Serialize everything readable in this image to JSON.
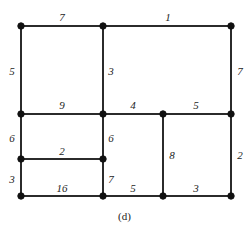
{
  "figure": {
    "caption": "(d)",
    "stroke_color": "#2b2b2b",
    "vertex_color": "#111111",
    "background_color": "#ffffff"
  },
  "chart_data": {
    "type": "diagram",
    "subtype": "planar-graph-rectangular-subdivision",
    "title": "",
    "caption": "(d)",
    "xlabel": "",
    "ylabel": "",
    "grid": false,
    "legend": null,
    "xlim": [
      0,
      249
    ],
    "ylim": [
      0,
      233
    ],
    "vertices": [
      {
        "id": "v1",
        "x": 21,
        "y": 26
      },
      {
        "id": "v2",
        "x": 103,
        "y": 26
      },
      {
        "id": "v3",
        "x": 231,
        "y": 26
      },
      {
        "id": "v4",
        "x": 21,
        "y": 114
      },
      {
        "id": "v5",
        "x": 103,
        "y": 114
      },
      {
        "id": "v6",
        "x": 163,
        "y": 114
      },
      {
        "id": "v7",
        "x": 231,
        "y": 114
      },
      {
        "id": "v8",
        "x": 21,
        "y": 159
      },
      {
        "id": "v9",
        "x": 103,
        "y": 159
      },
      {
        "id": "v10",
        "x": 21,
        "y": 196
      },
      {
        "id": "v11",
        "x": 103,
        "y": 196
      },
      {
        "id": "v12",
        "x": 163,
        "y": 196
      },
      {
        "id": "v13",
        "x": 231,
        "y": 196
      }
    ],
    "edges": [
      {
        "id": "e-top-left",
        "from": "v1",
        "to": "v2",
        "label": "7",
        "label_x": 62,
        "label_y": 17
      },
      {
        "id": "e-top-right",
        "from": "v2",
        "to": "v3",
        "label": "1",
        "label_x": 168,
        "label_y": 17
      },
      {
        "id": "e-left-upper",
        "from": "v1",
        "to": "v4",
        "label": "5",
        "label_x": 12,
        "label_y": 71
      },
      {
        "id": "e-mid-vert-upper",
        "from": "v2",
        "to": "v5",
        "label": "3",
        "label_x": 111,
        "label_y": 71
      },
      {
        "id": "e-right-upper",
        "from": "v3",
        "to": "v7",
        "label": "7",
        "label_x": 240,
        "label_y": 71
      },
      {
        "id": "e-mid-horiz-9",
        "from": "v4",
        "to": "v5",
        "label": "9",
        "label_x": 62,
        "label_y": 105
      },
      {
        "id": "e-mid-horiz-4",
        "from": "v5",
        "to": "v6",
        "label": "4",
        "label_x": 133,
        "label_y": 105
      },
      {
        "id": "e-mid-horiz-5",
        "from": "v6",
        "to": "v7",
        "label": "5",
        "label_x": 196,
        "label_y": 105
      },
      {
        "id": "e-left-mid",
        "from": "v4",
        "to": "v8",
        "label": "6",
        "label_x": 12,
        "label_y": 138
      },
      {
        "id": "e-mid-vert-6",
        "from": "v5",
        "to": "v9",
        "label": "6",
        "label_x": 111,
        "label_y": 138
      },
      {
        "id": "e-inner-8",
        "from": "v6",
        "to": "v12",
        "label": "8",
        "label_x": 172,
        "label_y": 155
      },
      {
        "id": "e-right-lower",
        "from": "v7",
        "to": "v13",
        "label": "2",
        "label_x": 240,
        "label_y": 155
      },
      {
        "id": "e-inner-2",
        "from": "v8",
        "to": "v9",
        "label": "2",
        "label_x": 62,
        "label_y": 151
      },
      {
        "id": "e-left-lower",
        "from": "v8",
        "to": "v10",
        "label": "3",
        "label_x": 12,
        "label_y": 179
      },
      {
        "id": "e-mid-vert-7",
        "from": "v9",
        "to": "v11",
        "label": "7",
        "label_x": 111,
        "label_y": 179
      },
      {
        "id": "e-bottom-16",
        "from": "v10",
        "to": "v11",
        "label": "16",
        "label_x": 62,
        "label_y": 188
      },
      {
        "id": "e-bottom-5",
        "from": "v11",
        "to": "v12",
        "label": "5",
        "label_x": 133,
        "label_y": 188
      },
      {
        "id": "e-bottom-3",
        "from": "v12",
        "to": "v13",
        "label": "3",
        "label_x": 196,
        "label_y": 188
      }
    ],
    "edge_labels": [
      "7",
      "1",
      "5",
      "3",
      "7",
      "9",
      "4",
      "5",
      "6",
      "6",
      "8",
      "2",
      "2",
      "3",
      "7",
      "16",
      "5",
      "3"
    ],
    "vertex_count": 13,
    "edge_count": 18
  }
}
